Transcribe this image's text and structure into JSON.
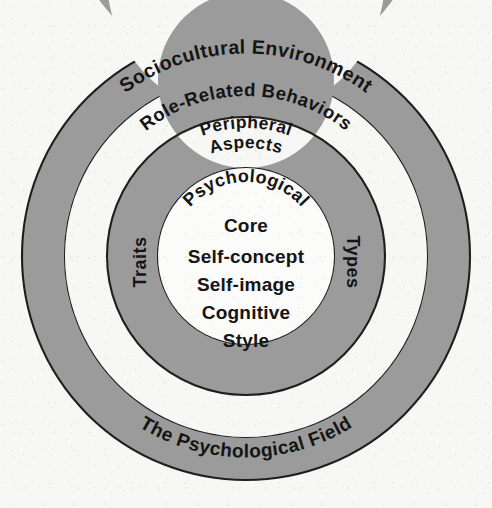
{
  "diagram": {
    "type": "concentric-circles",
    "title_present": false,
    "background_color": "#f7f7f5",
    "ring_color": "#9b9b9b",
    "gap_color": "#f7f7f5",
    "core_color": "#fbfbfa",
    "outline_color": "#1e1e1e",
    "text_color": "#141414",
    "center": {
      "x": 246,
      "y": 256
    },
    "layers": [
      {
        "id": "outer-ring",
        "name": "Sociocultural Environment / The Psychological Field",
        "shape": "annulus",
        "fill": "#9b9b9b",
        "outer_radius": 224,
        "inner_radius": 181,
        "labels": [
          {
            "text": "Sociocultural Environment",
            "placement": "arc-top"
          },
          {
            "text": "The Psychological Field",
            "placement": "arc-bottom"
          }
        ]
      },
      {
        "id": "gap-band",
        "name": "Role-Related Behaviors",
        "shape": "annulus",
        "fill": "#f7f7f5",
        "outer_radius": 181,
        "inner_radius": 139,
        "labels": [
          {
            "text": "Role-Related Behaviors",
            "placement": "arc-top"
          }
        ]
      },
      {
        "id": "middle-ring",
        "name": "Peripheral Aspects / Traits / Types",
        "shape": "annulus",
        "fill": "#9b9b9b",
        "outer_radius": 139,
        "inner_radius": 88,
        "labels": [
          {
            "text": "Peripheral",
            "placement": "arc-top-outer"
          },
          {
            "text": "Aspects",
            "placement": "arc-top-inner"
          },
          {
            "text": "Traits",
            "placement": "left-vertical"
          },
          {
            "text": "Types",
            "placement": "right-vertical"
          }
        ]
      },
      {
        "id": "core-circle",
        "name": "Psychological Core",
        "shape": "circle",
        "fill": "#fbfbfa",
        "outer_radius": 88,
        "labels": [
          {
            "text": "Psychological",
            "placement": "arc-top"
          },
          {
            "text": "Core",
            "placement": "center-line-1"
          },
          {
            "text": "Self-concept",
            "placement": "center-line-2"
          },
          {
            "text": "Self-image",
            "placement": "center-line-3"
          },
          {
            "text": "Cognitive",
            "placement": "center-line-4"
          },
          {
            "text": "Style",
            "placement": "center-line-5"
          }
        ]
      }
    ]
  },
  "labels": {
    "outer_top": "Sociocultural Environment",
    "outer_bottom": "The Psychological Field",
    "gap_top": "Role-Related Behaviors",
    "middle_top_a": "Peripheral",
    "middle_top_b": "Aspects",
    "middle_left": "Traits",
    "middle_right": "Types",
    "core_curved": "Psychological",
    "core_line_1": "Core",
    "core_line_2": "Self-concept",
    "core_line_3": "Self-image",
    "core_line_4": "Cognitive",
    "core_line_5": "Style"
  }
}
